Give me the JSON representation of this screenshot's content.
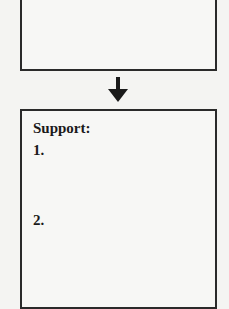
{
  "flowchart": {
    "top_box": {
      "content": ""
    },
    "arrow": {
      "direction": "down",
      "icon": "arrow-down-icon"
    },
    "bottom_box": {
      "heading": "Support:",
      "items": [
        {
          "number": "1.",
          "text": ""
        },
        {
          "number": "2.",
          "text": ""
        }
      ]
    }
  },
  "colors": {
    "border": "#2a2a2a",
    "background": "#f4f4f2",
    "text": "#1a1a1a"
  }
}
